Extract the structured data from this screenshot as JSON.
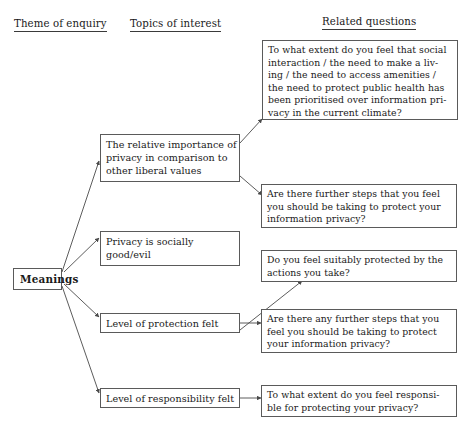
{
  "diagram": {
    "type": "tree-diagram",
    "line_color": "#4a4a4a",
    "box_border_color": "#5a5a5a",
    "text_color": "#1a1a1a",
    "background": "#ffffff"
  },
  "headers": [
    {
      "id": "theme",
      "label": "Theme of enquiry"
    },
    {
      "id": "topics",
      "label": "Topics of interest"
    },
    {
      "id": "questions",
      "label": "Related questions"
    }
  ],
  "root": {
    "id": "meanings",
    "label": "Meanings"
  },
  "topics": [
    {
      "id": "relative-importance",
      "lines": [
        "The relative importance of",
        "privacy in comparison to",
        "other liberal values"
      ]
    },
    {
      "id": "socially-good-evil",
      "lines": [
        "Privacy is socially",
        "good/evil"
      ]
    },
    {
      "id": "level-of-protection",
      "lines": [
        "Level of protection felt"
      ]
    },
    {
      "id": "level-of-responsibility",
      "lines": [
        "Level of responsibility felt"
      ]
    }
  ],
  "questions": [
    {
      "id": "q-prioritised-over-privacy",
      "lines": [
        "To what extent do you feel that social",
        "interaction / the need to make a liv-",
        "ing / the need to access amenities /",
        "the need to protect public health has",
        "been prioritised over information pri-",
        "vacy in the current climate?"
      ]
    },
    {
      "id": "q-further-steps-protect",
      "lines": [
        "Are there further steps that you feel",
        "you should be taking to protect your",
        "information privacy?"
      ]
    },
    {
      "id": "q-suitably-protected",
      "lines": [
        "Do you feel suitably protected by the",
        "actions you take?"
      ]
    },
    {
      "id": "q-any-further-steps",
      "lines": [
        "Are there any further steps that you",
        "feel you should be taking to protect",
        "your information privacy?"
      ]
    },
    {
      "id": "q-responsible-for-protecting",
      "lines": [
        "To what extent do you feel responsi-",
        "ble for protecting your privacy?"
      ]
    }
  ]
}
